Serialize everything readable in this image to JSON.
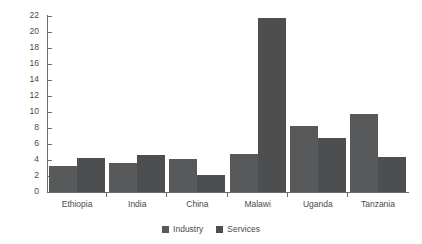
{
  "chart_data": {
    "type": "bar",
    "title": "",
    "xlabel": "",
    "ylabel": "Agriculture productivity gap",
    "ylim": [
      0,
      22
    ],
    "yticks": [
      0,
      2,
      4,
      6,
      8,
      10,
      12,
      14,
      16,
      18,
      20,
      22
    ],
    "grid": false,
    "legend_position": "bottom-center",
    "categories": [
      "Ethiopia",
      "India",
      "China",
      "Malawi",
      "Uganda",
      "Tanzania"
    ],
    "series": [
      {
        "name": "Industry",
        "color": "#58595b",
        "values": [
          3.2,
          3.6,
          4.1,
          4.8,
          8.3,
          9.8
        ]
      },
      {
        "name": "Services",
        "color": "#4d4e50",
        "values": [
          4.2,
          4.6,
          2.1,
          21.7,
          6.8,
          4.4
        ]
      }
    ]
  },
  "axis": {
    "y_title": "Agriculture productivity gap",
    "y_tick_labels": [
      "22",
      "20",
      "18",
      "16",
      "14",
      "12",
      "10",
      "8",
      "6",
      "4",
      "2",
      "0"
    ]
  },
  "legend": {
    "items": [
      {
        "label": "Industry",
        "color": "#58595b"
      },
      {
        "label": "Services",
        "color": "#4d4e50"
      }
    ]
  }
}
